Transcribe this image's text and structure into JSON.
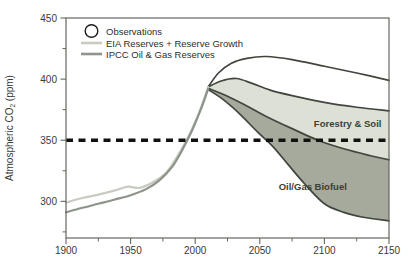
{
  "chart_data": {
    "type": "line",
    "title": "",
    "ylabel": {
      "text": "Atmospheric CO",
      "sub": "2",
      "suffix": " (ppm)"
    },
    "axes": {
      "x": {
        "lim": [
          1900,
          2150
        ],
        "ticks": [
          1900,
          1950,
          2000,
          2050,
          2100,
          2150
        ],
        "minor": [
          1925,
          1975,
          2025,
          2075,
          2125
        ]
      },
      "y": {
        "lim": [
          270,
          450
        ],
        "ticks": [
          300,
          350,
          400,
          450
        ],
        "minor": [
          275,
          325,
          375,
          425
        ]
      }
    },
    "reference_line": {
      "value": 350,
      "style": "dashed",
      "color": "#111111"
    },
    "colors": {
      "band_light": "#dde0d5",
      "band_dark": "#a5aa9c",
      "curve": "#41463e",
      "axis": "#65655f",
      "tick_text": "#3a3a36",
      "legend_text": "#2e2e2c",
      "annotation_text": "#3a3f38"
    },
    "legend": [
      {
        "label": "Observations",
        "marker": "circle",
        "color": "#1c1c1c"
      },
      {
        "label": "EIA Reserves + Reserve Growth",
        "marker": "line",
        "color": "#c7cbc0"
      },
      {
        "label": "IPCC Oil & Gas Reserves",
        "marker": "line",
        "color": "#8d948a"
      }
    ],
    "series": [
      {
        "id": "top-projection",
        "color": "#41463e",
        "width": 1.7,
        "points": [
          [
            2010,
            393.5
          ],
          [
            2018,
            405
          ],
          [
            2028,
            413
          ],
          [
            2040,
            417
          ],
          [
            2055,
            418.5
          ],
          [
            2075,
            416
          ],
          [
            2100,
            410.5
          ],
          [
            2125,
            405
          ],
          [
            2150,
            399
          ]
        ]
      },
      {
        "id": "forestry-upper",
        "color": "#41463e",
        "width": 1.7,
        "points": [
          [
            2010,
            393.5
          ],
          [
            2020,
            398.5
          ],
          [
            2032,
            400.5
          ],
          [
            2044,
            396.5
          ],
          [
            2058,
            391
          ],
          [
            2075,
            386.5
          ],
          [
            2100,
            381
          ],
          [
            2125,
            377
          ],
          [
            2150,
            374
          ]
        ]
      },
      {
        "id": "band-boundary",
        "color": "#41463e",
        "width": 1.7,
        "points": [
          [
            2010,
            392.5
          ],
          [
            2025,
            386
          ],
          [
            2040,
            378
          ],
          [
            2055,
            369.5
          ],
          [
            2075,
            359.5
          ],
          [
            2095,
            350
          ],
          [
            2115,
            343
          ],
          [
            2135,
            337.5
          ],
          [
            2150,
            334
          ]
        ]
      },
      {
        "id": "biofuel-lower",
        "color": "#41463e",
        "width": 1.7,
        "points": [
          [
            2010,
            391.5
          ],
          [
            2022,
            383
          ],
          [
            2035,
            371
          ],
          [
            2048,
            357
          ],
          [
            2060,
            345
          ],
          [
            2072,
            330
          ],
          [
            2085,
            314
          ],
          [
            2100,
            298
          ],
          [
            2115,
            291
          ],
          [
            2130,
            287
          ],
          [
            2150,
            284
          ]
        ]
      },
      {
        "id": "eia-historical",
        "color": "#c7cbc0",
        "width": 2.2,
        "points": [
          [
            1900,
            299
          ],
          [
            1912,
            302.5
          ],
          [
            1925,
            305.5
          ],
          [
            1938,
            309
          ],
          [
            1948,
            312
          ],
          [
            1957,
            311
          ],
          [
            1968,
            316
          ],
          [
            1978,
            324
          ],
          [
            1988,
            340
          ],
          [
            1997,
            358
          ],
          [
            2004,
            375
          ],
          [
            2010,
            393.5
          ]
        ]
      },
      {
        "id": "ipcc-historical",
        "color": "#8d948a",
        "width": 2.2,
        "points": [
          [
            1900,
            291
          ],
          [
            1912,
            294.5
          ],
          [
            1925,
            298
          ],
          [
            1938,
            301.5
          ],
          [
            1950,
            305
          ],
          [
            1962,
            310
          ],
          [
            1972,
            317
          ],
          [
            1982,
            328
          ],
          [
            1990,
            342
          ],
          [
            1998,
            359
          ],
          [
            2005,
            377
          ],
          [
            2010,
            392
          ]
        ]
      }
    ],
    "areas": [
      {
        "name": "forestry-soil-band",
        "between": [
          "forestry-upper",
          "band-boundary"
        ],
        "fill": "#dde0d5"
      },
      {
        "name": "oil-gas-biofuel-band",
        "between": [
          "band-boundary",
          "biofuel-lower"
        ],
        "fill": "#a5aa9c"
      }
    ],
    "annotations": [
      {
        "text": "Forestry & Soil",
        "year": 2118,
        "ppm": 363
      },
      {
        "text": "Oil/Gas Biofuel",
        "year": 2091,
        "ppm": 312
      }
    ]
  }
}
